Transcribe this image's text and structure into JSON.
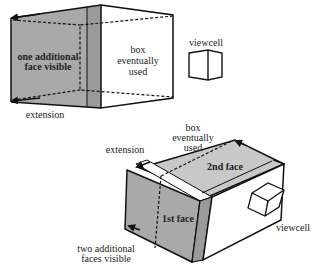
{
  "figure": {
    "top": {
      "labels": {
        "additional_face_line1": "one additional",
        "additional_face_line2": "face visible",
        "box_line1": "box",
        "box_line2": "eventually",
        "box_line3": "used",
        "viewcell": "viewcell",
        "extension": "extension"
      }
    },
    "bottom": {
      "labels": {
        "extension": "extension",
        "box_line1": "box",
        "box_line2": "eventually",
        "box_line3": "used",
        "second_face": "2nd face",
        "first_face": "1st face",
        "viewcell": "viewcell",
        "additional_faces_line1": "two additional",
        "additional_faces_line2": "faces visible"
      }
    },
    "colors": {
      "face_gray": "#a9a9a9",
      "face_gray_light": "#c8c8c8",
      "strip_gray": "#9a9a9a",
      "line": "#111111",
      "background": "#ffffff"
    }
  }
}
